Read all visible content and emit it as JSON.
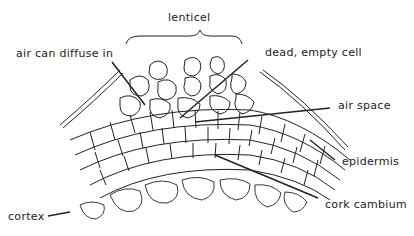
{
  "diagram": {
    "type": "biological cross-section",
    "labels": {
      "lenticel": "lenticel",
      "air_diffuse": "air can diffuse in",
      "dead_cell": "dead, empty cell",
      "air_space": "air space",
      "epidermis": "epidermis",
      "cork_cambium": "cork cambium",
      "cortex": "cortex"
    },
    "colors": {
      "stroke": "#222222",
      "background": "#ffffff"
    }
  }
}
